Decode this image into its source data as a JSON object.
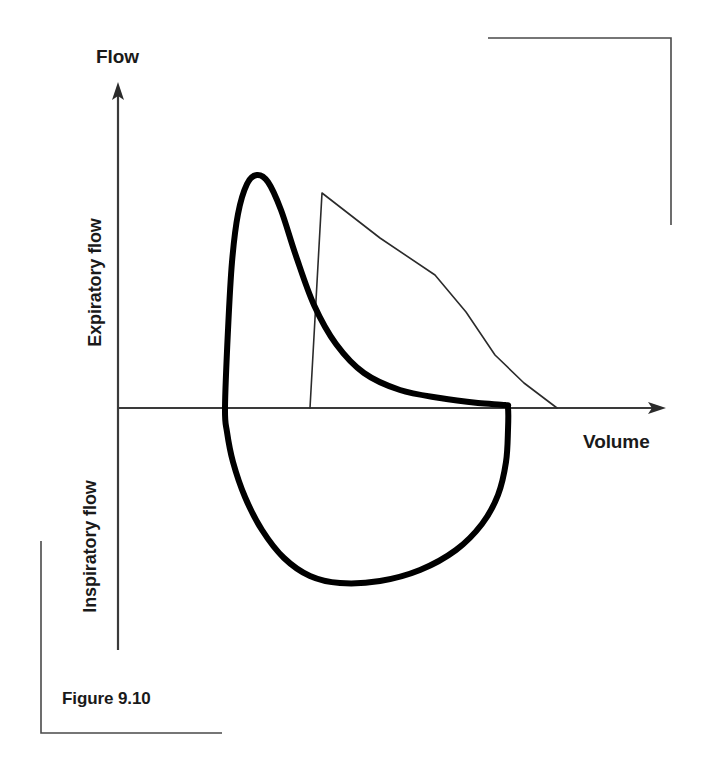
{
  "figure": {
    "caption": "Figure 9.10",
    "axes": {
      "y_label": "Flow",
      "x_label": "Volume",
      "upper_quadrant_label": "Expiratory flow",
      "lower_quadrant_label": "Inspiratory flow"
    },
    "colors": {
      "ink": "#1a1a1a",
      "axis": "#3a3a3a",
      "thin_curve": "#2b2b2b",
      "thick_curve": "#000000",
      "bracket": "#4a4a4a",
      "background": "#ffffff"
    }
  },
  "chart_data": {
    "type": "line",
    "title": "Figure 9.10",
    "xlabel": "Volume",
    "ylabel": "Flow",
    "grid": false,
    "legend_position": "none",
    "annotations": [
      "Expiratory flow",
      "Inspiratory flow"
    ],
    "axis_description": {
      "x_axis_y_pixel": 408,
      "y_axis_x_pixel": 118,
      "x_axis_direction": "increasing volume to the right",
      "y_axis_direction": "expiratory flow above baseline, inspiratory flow below baseline"
    },
    "series": [
      {
        "name": "Flow-volume loop (patient, bold)",
        "style": "thick-solid",
        "linewidth": 6,
        "closed_loop": true,
        "points": [
          [
            225,
            408
          ],
          [
            228,
            330
          ],
          [
            232,
            262
          ],
          [
            238,
            214
          ],
          [
            247,
            184
          ],
          [
            257,
            175
          ],
          [
            268,
            182
          ],
          [
            281,
            210
          ],
          [
            296,
            256
          ],
          [
            314,
            305
          ],
          [
            336,
            344
          ],
          [
            364,
            373
          ],
          [
            400,
            390
          ],
          [
            440,
            398
          ],
          [
            478,
            403
          ],
          [
            505,
            405
          ],
          [
            508,
            408
          ],
          [
            508,
            430
          ],
          [
            506,
            462
          ],
          [
            498,
            495
          ],
          [
            482,
            524
          ],
          [
            456,
            550
          ],
          [
            420,
            570
          ],
          [
            380,
            581
          ],
          [
            340,
            583
          ],
          [
            310,
            576
          ],
          [
            284,
            558
          ],
          [
            262,
            530
          ],
          [
            245,
            497
          ],
          [
            233,
            462
          ],
          [
            227,
            432
          ],
          [
            225,
            408
          ]
        ]
      },
      {
        "name": "Predicted / reference expiratory curve (thin)",
        "style": "thin-solid",
        "linewidth": 1.6,
        "closed_loop": false,
        "points": [
          [
            310,
            408
          ],
          [
            322,
            193
          ],
          [
            380,
            238
          ],
          [
            435,
            275
          ],
          [
            466,
            312
          ],
          [
            495,
            355
          ],
          [
            524,
            383
          ],
          [
            557,
            408
          ]
        ]
      }
    ],
    "decorations": {
      "corner_bracket_top_right": [
        [
          488,
          38
        ],
        [
          671,
          38
        ],
        [
          671,
          225
        ]
      ],
      "corner_bracket_bottom_left": [
        [
          41,
          541
        ],
        [
          41,
          733
        ],
        [
          222,
          733
        ]
      ]
    }
  }
}
